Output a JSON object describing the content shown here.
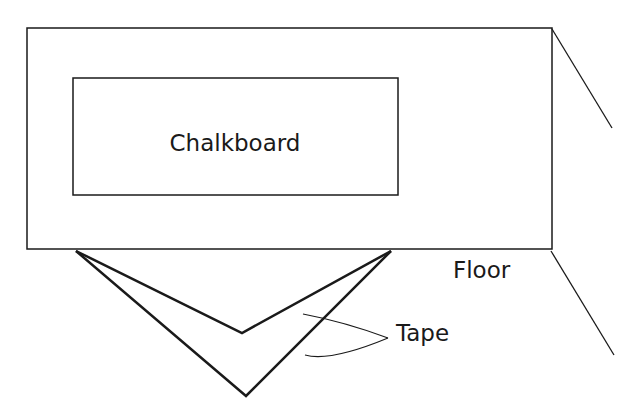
{
  "diagram": {
    "labels": {
      "chalkboard": "Chalkboard",
      "floor": "Floor",
      "tape": "Tape"
    },
    "colors": {
      "stroke": "#1a1a1a",
      "background": "#ffffff"
    }
  }
}
